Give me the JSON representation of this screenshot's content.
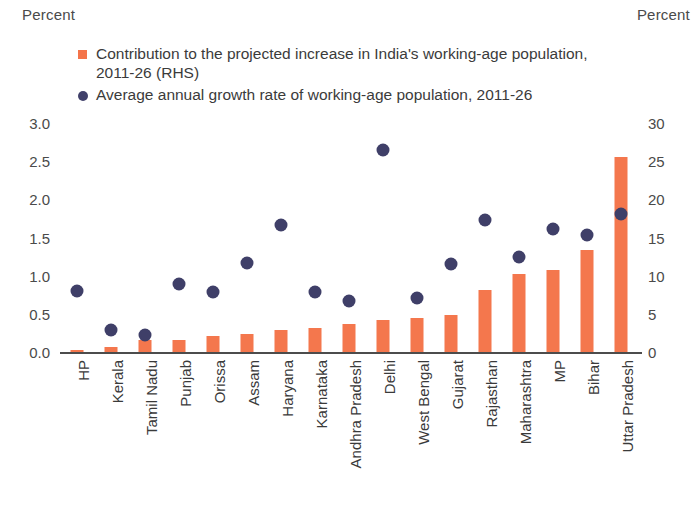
{
  "axis_captions": {
    "left": "Percent",
    "right": "Percent"
  },
  "legend": [
    {
      "marker": "square",
      "color": "#F4744A",
      "label": "Contribution to the projected increase in India's working-age population, 2011-26 (RHS)"
    },
    {
      "marker": "dot",
      "color": "#40406A",
      "label": "Average annual growth rate of working-age population, 2011-26"
    }
  ],
  "chart_data": {
    "type": "bar",
    "title": "",
    "xlabel": "",
    "ylabel": "Percent",
    "y2label": "Percent",
    "grid": false,
    "legend_position": "top",
    "ylim": [
      0,
      3.0
    ],
    "y2lim": [
      0,
      30
    ],
    "yticks": [
      "0.0",
      "0.5",
      "1.0",
      "1.5",
      "2.0",
      "2.5",
      "3.0"
    ],
    "y2ticks": [
      "0",
      "5",
      "10",
      "15",
      "20",
      "25",
      "30"
    ],
    "categories": [
      "HP",
      "Kerala",
      "Tamil Nadu",
      "Punjab",
      "Orissa",
      "Assam",
      "Haryana",
      "Karnataka",
      "Andhra Pradesh",
      "Delhi",
      "West Bengal",
      "Gujarat",
      "Rajasthan",
      "Maharashtra",
      "MP",
      "Bihar",
      "Uttar Pradesh"
    ],
    "series": [
      {
        "name": "Contribution to the projected increase in India's working-age population, 2011-26 (RHS)",
        "type": "bar",
        "axis": "right",
        "color": "#F4774D",
        "values": [
          0.3,
          0.7,
          1.6,
          1.6,
          2.1,
          2.3,
          2.9,
          3.1,
          3.7,
          4.2,
          4.4,
          4.8,
          8.1,
          10.2,
          10.7,
          13.3,
          25.6
        ]
      },
      {
        "name": "Average annual growth rate of working-age population, 2011-26",
        "type": "scatter",
        "axis": "left",
        "color": "#3F3F68",
        "values": [
          0.8,
          0.29,
          0.22,
          0.89,
          0.79,
          1.17,
          1.66,
          0.78,
          0.67,
          2.65,
          0.71,
          1.15,
          1.73,
          1.25,
          1.61,
          1.53,
          1.81
        ]
      }
    ]
  }
}
